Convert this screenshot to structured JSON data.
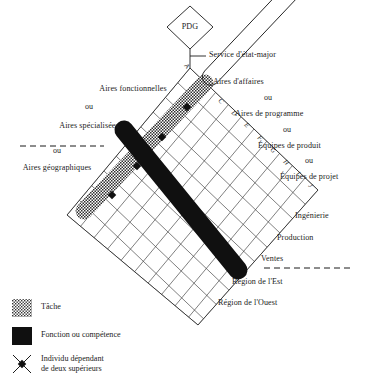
{
  "figure": {
    "type": "matrix-organization-diagram",
    "top_node": {
      "shape": "diamond",
      "label": "PDG"
    },
    "staff_connector": {
      "label": "Service d'état-major"
    }
  },
  "axis_left": {
    "lines": [
      "Aires fonctionnelles",
      "ou",
      "Aires spécialisées",
      "ou",
      "Aires géographiques"
    ],
    "line1": "Aires fonctionnelles",
    "or1": "ou",
    "line2": "Aires spécialisées",
    "or2": "ou",
    "line3": "Aires géographiques",
    "divider": "dashed"
  },
  "axis_right": {
    "lines": [
      "Aires d'affaires",
      "ou",
      "Aires de programme",
      "ou",
      "Équipes de produit",
      "ou",
      "Équipes de projet"
    ],
    "line1": "Aires d'affaires",
    "or1": "ou",
    "line2": "Aires de programme",
    "or2": "ou",
    "line3": "Équipes de produit",
    "or3": "ou",
    "line4": "Équipes de projet"
  },
  "axis_lower_right": {
    "lines": [
      "Ingénierie",
      "Production",
      "Ventes",
      "Région de l'Est",
      "Région de l'Ouest"
    ],
    "item1": "Ingénierie",
    "item2": "Production",
    "item3": "Ventes",
    "item4": "Région de l'Est",
    "item5": "Région de l'Ouest",
    "divider": "dashed"
  },
  "grid_letters": [
    "A",
    "C",
    "D",
    "E",
    "F",
    "G",
    "H",
    "I",
    "J"
  ],
  "letters": {
    "a": "A",
    "c": "C",
    "d": "D",
    "e": "E",
    "f": "F",
    "g": "G",
    "h": "H",
    "i": "I",
    "j": "J"
  },
  "legend": {
    "items": [
      {
        "swatch": "stipple",
        "label": "Tâche"
      },
      {
        "swatch": "solid-black",
        "label": "Fonction ou compétence"
      },
      {
        "swatch": "cross-node",
        "label": "Individu dépendant\nde deux supérieurs"
      }
    ],
    "item1_label": "Tâche",
    "item2_label": "Fonction ou compétence",
    "item3_label": "Individu dépendant\nde deux supérieurs"
  },
  "colors": {
    "ink": "#1b1b1b",
    "grid_line": "#2b2b2b",
    "task_bar_fill": "#b9b9b9",
    "function_bar_fill": "#101010",
    "page_background": "#ffffff"
  }
}
